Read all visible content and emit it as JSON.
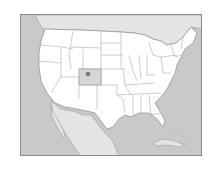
{
  "map": {
    "type": "locator-map",
    "region": "United States (contiguous)",
    "highlighted_state": "Colorado",
    "marker": "Denver",
    "colors": {
      "ocean": "#c9c9c9",
      "foreign_land": "#e4e4e4",
      "us_state_fill": "#ffffff",
      "highlight_fill": "#d6d6d6",
      "border": "#8c8c8c",
      "marker": "#7a7a7a"
    }
  }
}
